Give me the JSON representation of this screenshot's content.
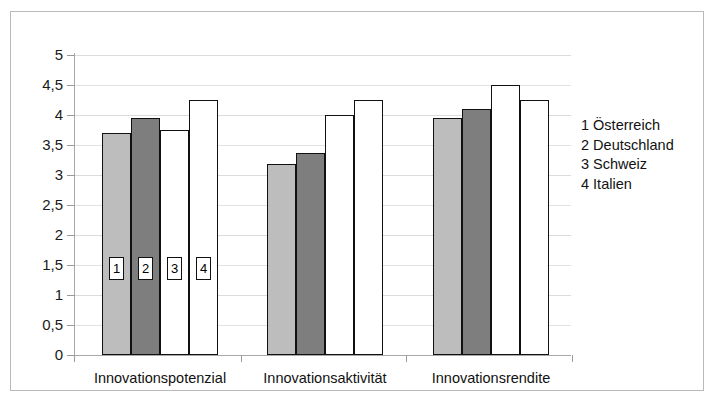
{
  "chart_data": {
    "type": "bar",
    "title": "",
    "subtitle": "",
    "xlabel": "",
    "ylabel": "",
    "ylim": [
      0,
      5
    ],
    "ytick_values": [
      0,
      0.5,
      1,
      1.5,
      2,
      2.5,
      3,
      3.5,
      4,
      4.5,
      5
    ],
    "ytick_labels": [
      "0",
      "0,5",
      "1",
      "1,5",
      "2",
      "2,5",
      "3",
      "3,5",
      "4",
      "4,5",
      "5"
    ],
    "grid": true,
    "legend_position": "right",
    "categories": [
      "Innovationspotenzial",
      "Innovationsaktivität",
      "Innovationsrendite"
    ],
    "series": [
      {
        "name": "Österreich",
        "key": "1",
        "color": "#bdbdbd",
        "values": [
          3.7,
          3.18,
          3.95
        ]
      },
      {
        "name": "Deutschland",
        "key": "2",
        "color": "#7e7e7e",
        "values": [
          3.95,
          3.37,
          4.1
        ]
      },
      {
        "name": "Schweiz",
        "key": "3",
        "color": "#ffffff",
        "values": [
          3.75,
          4.0,
          4.5
        ]
      },
      {
        "name": "Italien",
        "key": "4",
        "color": "#ffffff",
        "values": [
          4.25,
          4.25,
          4.25
        ]
      }
    ],
    "bar_annotations": [
      "1",
      "2",
      "3",
      "4"
    ],
    "legend_entries": [
      "1 Österreich",
      "2 Deutschland",
      "3 Schweiz",
      "4 Italien"
    ]
  },
  "legend": {
    "items": [
      {
        "label": "1 Österreich"
      },
      {
        "label": "2 Deutschland"
      },
      {
        "label": "3 Schweiz"
      },
      {
        "label": "4 Italien"
      }
    ]
  },
  "axis": {
    "y_labels": [
      "5",
      "4,5",
      "4",
      "3,5",
      "3",
      "2,5",
      "2",
      "1,5",
      "1",
      "0,5",
      "0"
    ],
    "x_labels": [
      "Innovationspotenzial",
      "Innovationsaktivität",
      "Innovationsrendite"
    ]
  }
}
